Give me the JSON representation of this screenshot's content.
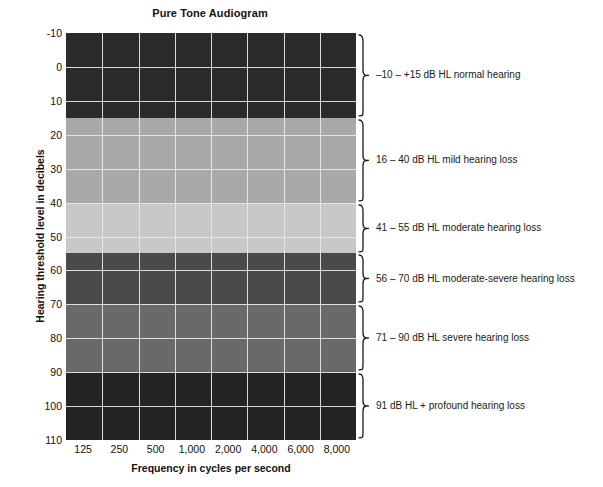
{
  "chart_data": {
    "type": "heatmap",
    "title": "Pure Tone Audiogram",
    "xlabel": "Frequency in cycles per second",
    "ylabel": "Hearing threshold level in decibels",
    "grid": true,
    "legend_position": "right",
    "xlim": [
      125,
      8000
    ],
    "ylim": [
      -10,
      110
    ],
    "y_axis_inverted": true,
    "x_tick_labels": [
      "125",
      "250",
      "500",
      "1,000",
      "2,000",
      "4,000",
      "6,000",
      "8,000"
    ],
    "y_tick_labels": [
      "-10",
      "0",
      "10",
      "20",
      "30",
      "40",
      "50",
      "60",
      "70",
      "80",
      "90",
      "100",
      "110"
    ],
    "categories": [
      "normal hearing",
      "mild hearing loss",
      "moderate hearing loss",
      "moderate-severe hearing loss",
      "severe hearing loss",
      "profound hearing loss"
    ],
    "bands": [
      {
        "name": "normal hearing",
        "db_from": -10,
        "db_to": 15,
        "range_text": "–10 – +15 dB HL",
        "label": "–10 – +15 dB HL normal hearing",
        "color": "#2b2b2b"
      },
      {
        "name": "mild hearing loss",
        "db_from": 16,
        "db_to": 40,
        "range_text": "16 – 40 dB HL",
        "label": "16 – 40 dB HL mild hearing loss",
        "color": "#a9a9a9"
      },
      {
        "name": "moderate hearing loss",
        "db_from": 41,
        "db_to": 55,
        "range_text": "41 – 55 dB HL",
        "label": "41 – 55 dB HL moderate hearing loss",
        "color": "#c8c8c8"
      },
      {
        "name": "moderate-severe hearing loss",
        "db_from": 56,
        "db_to": 70,
        "range_text": "56 – 70 dB HL",
        "label": "56 – 70 dB HL moderate-severe hearing loss",
        "color": "#4a4a4a"
      },
      {
        "name": "severe hearing loss",
        "db_from": 71,
        "db_to": 90,
        "range_text": "71 – 90 dB HL",
        "label": "71 – 90 dB HL severe hearing loss",
        "color": "#696969"
      },
      {
        "name": "profound hearing loss",
        "db_from": 91,
        "db_to": 110,
        "range_text": "91 dB HL +",
        "label": "91 dB HL + profound hearing loss",
        "color": "#242424"
      }
    ],
    "gridline_color": "#e9e9e9",
    "background_color": "#ffffff"
  }
}
